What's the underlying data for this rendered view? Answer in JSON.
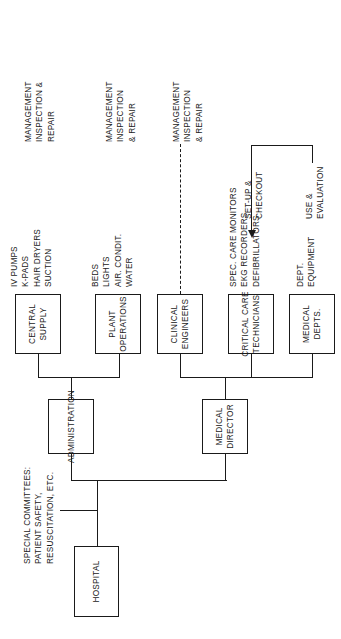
{
  "diagram": {
    "orientation": "rotated-90-ccw",
    "colors": {
      "stroke": "#1a1a1a",
      "background": "#ffffff"
    },
    "boxes": {
      "hospital": {
        "line1": "HOSPITAL"
      },
      "administration": {
        "line1": "ADMINISTRATION"
      },
      "medical_director": {
        "line1": "MEDICAL",
        "line2": "DIRECTOR"
      },
      "central_supply": {
        "line1": "CENTRAL",
        "line2": "SUPPLY"
      },
      "plant_operations": {
        "line1": "PLANT",
        "line2": "OPERATIONS"
      },
      "clinical_engineers": {
        "line1": "CLINICAL",
        "line2": "ENGINEERS"
      },
      "critical_care_technicians": {
        "line1": "CRITICAL CARE",
        "line2": "TECHNICIANS"
      },
      "medical_depts": {
        "line1": "MEDICAL",
        "line2": "DEPTS."
      }
    },
    "notes": {
      "special_committees": {
        "line1": "SPECIAL COMMITTEES:",
        "line2": "PATIENT SAFETY,",
        "line3": "RESUSCITATION, ETC."
      },
      "central_supply_equipment": {
        "line1": "IV PUMPS",
        "line2": "K-PADS",
        "line3": "HAIR DRYERS",
        "line4": "SUCTION"
      },
      "plant_operations_equipment": {
        "line1": "BEDS",
        "line2": "LIGHTS",
        "line3": "AIR. CONDIT.",
        "line4": "WATER"
      },
      "critical_care_equipment": {
        "line1": "SPEC. CARE MONITORS",
        "line2": "EKG RECORDERS",
        "line3": "DEFIBRILLATORS"
      },
      "medical_depts_equipment": {
        "line1": "DEPT.",
        "line2": "EQUIPMENT"
      },
      "mir_central_supply": {
        "line1": "MANAGEMENT",
        "line2": "INSPECTION &",
        "line3": "REPAIR"
      },
      "mir_plant_operations": {
        "line1": "MANAGEMENT",
        "line2": "INSPECTION",
        "line3": "& REPAIR"
      },
      "mir_clinical_engineers": {
        "line1": "MANAGEMENT",
        "line2": "INSPECTION",
        "line3": "& REPAIR"
      },
      "setup_checkout": {
        "line1": "SET-UP &",
        "line2": "CHECKOUT"
      },
      "use_evaluation": {
        "line1": "USE &",
        "line2": "EVALUATION"
      }
    }
  }
}
